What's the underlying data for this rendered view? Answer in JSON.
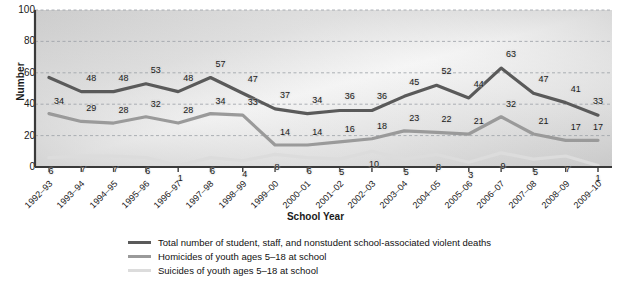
{
  "chart_data": {
    "type": "line",
    "title": "",
    "xlabel": "School Year",
    "ylabel": "Number",
    "ylim": [
      0,
      100
    ],
    "yticks": [
      0,
      20,
      40,
      60,
      80,
      100
    ],
    "grid": true,
    "legend_position": "bottom",
    "categories": [
      "1992–93",
      "1993–94",
      "1994–95",
      "1995–96",
      "1996–97",
      "1997–98",
      "1998–99",
      "1999–00",
      "2000–01",
      "2001–02",
      "2002–03",
      "2003–04",
      "2004–05",
      "2005–06",
      "2006–07",
      "2007–08",
      "2008–09",
      "2009–10"
    ],
    "series": [
      {
        "name": "Total number of student, staff, and nonstudent school-associated violent deaths",
        "color": "#5a5a5a",
        "values": [
          57,
          48,
          48,
          53,
          48,
          57,
          47,
          37,
          34,
          36,
          36,
          45,
          52,
          44,
          63,
          47,
          41,
          33
        ],
        "labels": [
          "",
          "48",
          "48",
          "53",
          "48",
          "57",
          "47",
          "37",
          "34",
          "36",
          "36",
          "45",
          "52",
          "44",
          "63",
          "47",
          "41",
          "33"
        ]
      },
      {
        "name": "Homicides of youth ages 5–18 at school",
        "color": "#9a9a9a",
        "values": [
          34,
          29,
          28,
          32,
          28,
          34,
          33,
          14,
          14,
          16,
          18,
          23,
          22,
          21,
          32,
          21,
          17,
          17
        ],
        "labels": [
          "34",
          "29",
          "28",
          "32",
          "28",
          "34",
          "33",
          "14",
          "14",
          "16",
          "18",
          "23",
          "22",
          "21",
          "32",
          "21",
          "17",
          "17"
        ]
      },
      {
        "name": "Suicides of youth ages 5–18 at school",
        "color": "#dcdcdc",
        "values": [
          6,
          7,
          7,
          6,
          1,
          6,
          4,
          8,
          6,
          5,
          10,
          5,
          8,
          3,
          9,
          5,
          7,
          1
        ],
        "labels": [
          "6",
          "7",
          "7",
          "6",
          "1",
          "6",
          "4",
          "8",
          "6",
          "5",
          "10",
          "5",
          "8",
          "3",
          "9",
          "5",
          "7",
          "1"
        ]
      }
    ]
  },
  "axis": {
    "y_title": "Number",
    "x_title": "School Year"
  },
  "colors": {
    "total": "#5a5a5a",
    "homicides": "#9a9a9a",
    "suicides": "#dcdcdc",
    "grid": "#9aa0a6",
    "axis": "#3a3a3a",
    "plot_bg_light": "#f2f2f2",
    "plot_bg_dark": "#c9c9c9"
  }
}
